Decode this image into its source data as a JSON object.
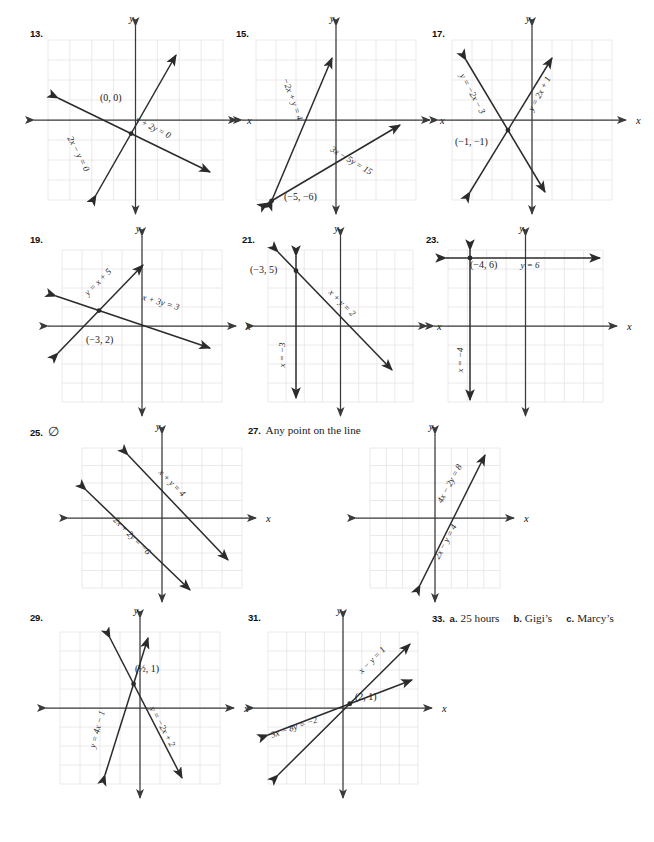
{
  "page": {
    "width": 654,
    "height": 842,
    "background": "#ffffff",
    "grid_color": "#e9e2e4",
    "axis_color": "#3a3a3a",
    "line_color": "#2b2b2b",
    "text_color": "#1a1a1a"
  },
  "axis_labels": {
    "x": "x",
    "y": "y"
  },
  "problems": [
    {
      "id": "13",
      "number": "13.",
      "x": 30,
      "y": 28,
      "graph": {
        "x": 48,
        "y": 40,
        "w": 175,
        "h": 160,
        "cols": 8,
        "rows": 8,
        "cell": 15.5
      },
      "point_labels": [
        {
          "text": "(0, 0)",
          "x": 100,
          "y": 101
        }
      ],
      "line_labels": [
        {
          "text": "2x − y = 0",
          "x": 76,
          "y": 155,
          "rot": 63
        },
        {
          "text": "x + 2y = 0",
          "x": 152,
          "y": 130,
          "rot": 27
        }
      ],
      "lines": [
        {
          "name": "2x-y=0",
          "x1": 96,
          "y1": 195,
          "x2": 176,
          "y2": 55
        },
        {
          "name": "x+2y=0",
          "x1": 58,
          "y1": 98,
          "x2": 210,
          "y2": 172
        }
      ]
    },
    {
      "id": "15",
      "number": "15.",
      "x": 236,
      "y": 28,
      "graph": {
        "x": 256,
        "y": 40,
        "w": 160,
        "h": 160,
        "cols": 8,
        "rows": 8,
        "cell": 15.5
      },
      "point_labels": [
        {
          "text": "(−5, −6)",
          "x": 284,
          "y": 200
        }
      ],
      "line_labels": [
        {
          "text": "−2x + y = 4",
          "x": 290,
          "y": 100,
          "rot": 70
        },
        {
          "text": "3x − 5y = 15",
          "x": 350,
          "y": 163,
          "rot": 31
        }
      ],
      "lines": [
        {
          "name": "-2x+y=4",
          "x1": 272,
          "y1": 200,
          "x2": 332,
          "y2": 58
        },
        {
          "name": "3x-5y=15",
          "x1": 268,
          "y1": 203,
          "x2": 400,
          "y2": 125
        }
      ]
    },
    {
      "id": "17",
      "number": "17.",
      "x": 432,
      "y": 28,
      "graph": {
        "x": 452,
        "y": 40,
        "w": 160,
        "h": 160,
        "cols": 8,
        "rows": 8,
        "cell": 15.5
      },
      "point_labels": [
        {
          "text": "(−1, −1)",
          "x": 455,
          "y": 145
        }
      ],
      "line_labels": [
        {
          "text": "y = −2x − 3",
          "x": 470,
          "y": 95,
          "rot": 62
        },
        {
          "text": "y = 2x + 1",
          "x": 542,
          "y": 95,
          "rot": -62
        }
      ],
      "lines": [
        {
          "name": "y=-2x-3",
          "x1": 466,
          "y1": 60,
          "x2": 545,
          "y2": 192
        },
        {
          "name": "y=2x+1",
          "x1": 470,
          "y1": 192,
          "x2": 552,
          "y2": 58
        }
      ]
    },
    {
      "id": "19",
      "number": "19.",
      "x": 30,
      "y": 234,
      "graph": {
        "x": 62,
        "y": 250,
        "w": 160,
        "h": 152,
        "cols": 8,
        "rows": 8,
        "cell": 15.5
      },
      "point_labels": [
        {
          "text": "(−3, 2)",
          "x": 86,
          "y": 343
        }
      ],
      "line_labels": [
        {
          "text": "y = x + 5",
          "x": 100,
          "y": 284,
          "rot": -45
        },
        {
          "text": "x + 3y = 3",
          "x": 160,
          "y": 305,
          "rot": 16
        }
      ],
      "lines": [
        {
          "name": "y=x+5",
          "x1": 58,
          "y1": 353,
          "x2": 143,
          "y2": 265
        },
        {
          "name": "x+3y=3",
          "x1": 56,
          "y1": 296,
          "x2": 210,
          "y2": 348
        }
      ]
    },
    {
      "id": "21",
      "number": "21.",
      "x": 242,
      "y": 234,
      "graph": {
        "x": 268,
        "y": 250,
        "w": 145,
        "h": 152,
        "cols": 8,
        "rows": 8,
        "cell": 15.5
      },
      "point_labels": [
        {
          "text": "(−3, 5)",
          "x": 250,
          "y": 273
        }
      ],
      "line_labels": [
        {
          "text": "x = −3",
          "x": 285,
          "y": 355,
          "rot": -90
        },
        {
          "text": "x + y = 2",
          "x": 340,
          "y": 305,
          "rot": 45
        }
      ],
      "lines": [
        {
          "name": "x=-3",
          "x1": 296,
          "y1": 256,
          "x2": 296,
          "y2": 398
        },
        {
          "name": "x+y=2",
          "x1": 278,
          "y1": 252,
          "x2": 392,
          "y2": 370
        }
      ]
    },
    {
      "id": "23",
      "number": "23.",
      "x": 426,
      "y": 234,
      "graph": {
        "x": 448,
        "y": 250,
        "w": 155,
        "h": 152,
        "cols": 8,
        "rows": 8,
        "cell": 15.5
      },
      "point_labels": [
        {
          "text": "(−4, 6)",
          "x": 470,
          "y": 268
        }
      ],
      "line_labels": [
        {
          "text": "y = 6",
          "x": 530,
          "y": 268
        },
        {
          "text": "x = −4",
          "x": 463,
          "y": 360,
          "rot": -90
        }
      ],
      "lines": [
        {
          "name": "y=6",
          "x1": 446,
          "y1": 258,
          "x2": 600,
          "y2": 258
        },
        {
          "name": "x=-4",
          "x1": 470,
          "y1": 250,
          "x2": 470,
          "y2": 400
        }
      ]
    },
    {
      "id": "25",
      "number": "25.",
      "x": 30,
      "y": 424,
      "answer_symbol": "∅",
      "graph": {
        "x": 82,
        "y": 448,
        "w": 160,
        "h": 140,
        "cols": 8,
        "rows": 8,
        "cell": 15.5
      },
      "point_labels": [],
      "line_labels": [
        {
          "text": "x + y = 4",
          "x": 170,
          "y": 485,
          "rot": 45
        },
        {
          "text": "2x + 2y = −6",
          "x": 130,
          "y": 538,
          "rot": 45
        }
      ],
      "lines": [
        {
          "name": "x+y=4",
          "x1": 128,
          "y1": 455,
          "x2": 228,
          "y2": 560
        },
        {
          "name": "2x+2y=-6",
          "x1": 86,
          "y1": 490,
          "x2": 190,
          "y2": 590
        }
      ]
    },
    {
      "id": "27",
      "number": "27.",
      "x": 248,
      "y": 424,
      "answer_text": "Any point on the line",
      "graph": {
        "x": 370,
        "y": 448,
        "w": 130,
        "h": 140,
        "cols": 8,
        "rows": 8,
        "cell": 15.5
      },
      "point_labels": [],
      "line_labels": [
        {
          "text": "4x − 2y = 8",
          "x": 452,
          "y": 485,
          "rot": -62
        },
        {
          "text": "2x − y = 4",
          "x": 448,
          "y": 543,
          "rot": -62
        }
      ],
      "lines": [
        {
          "name": "4x-2y=8",
          "x1": 420,
          "y1": 585,
          "x2": 485,
          "y2": 455
        }
      ]
    },
    {
      "id": "29",
      "number": "29.",
      "x": 30,
      "y": 612,
      "graph": {
        "x": 60,
        "y": 632,
        "w": 160,
        "h": 152,
        "cols": 8,
        "rows": 8,
        "cell": 15.5
      },
      "point_labels": [
        {
          "text": "(½, 1)",
          "x": 135,
          "y": 672
        }
      ],
      "line_labels": [
        {
          "text": "y = 4x − 1",
          "x": 100,
          "y": 730,
          "rot": -75
        },
        {
          "text": "y = −2x + 2",
          "x": 160,
          "y": 728,
          "rot": 62
        }
      ],
      "lines": [
        {
          "name": "y=4x-1",
          "x1": 105,
          "y1": 775,
          "x2": 148,
          "y2": 638
        },
        {
          "name": "y=-2x+2",
          "x1": 110,
          "y1": 638,
          "x2": 182,
          "y2": 778
        }
      ]
    },
    {
      "id": "31",
      "number": "31.",
      "x": 248,
      "y": 612,
      "graph": {
        "x": 268,
        "y": 632,
        "w": 150,
        "h": 152,
        "cols": 8,
        "rows": 8,
        "cell": 15.5
      },
      "point_labels": [
        {
          "text": "(2, 1)",
          "x": 355,
          "y": 700
        }
      ],
      "line_labels": [
        {
          "text": "x − y = 1",
          "x": 374,
          "y": 662,
          "rot": -45
        },
        {
          "text": "3x − 8y = −2",
          "x": 295,
          "y": 730,
          "rot": -19
        }
      ],
      "lines": [
        {
          "name": "x-y=1",
          "x1": 278,
          "y1": 775,
          "x2": 410,
          "y2": 644
        },
        {
          "name": "3x-8y=-2",
          "x1": 268,
          "y1": 735,
          "x2": 412,
          "y2": 680
        }
      ]
    },
    {
      "id": "33",
      "number": "33.",
      "x": 432,
      "y": 612,
      "answer_parts": [
        {
          "letter": "a.",
          "text": "25 hours"
        },
        {
          "letter": "b.",
          "text": "Gigi’s"
        },
        {
          "letter": "c.",
          "text": "Marcy’s"
        }
      ]
    }
  ]
}
